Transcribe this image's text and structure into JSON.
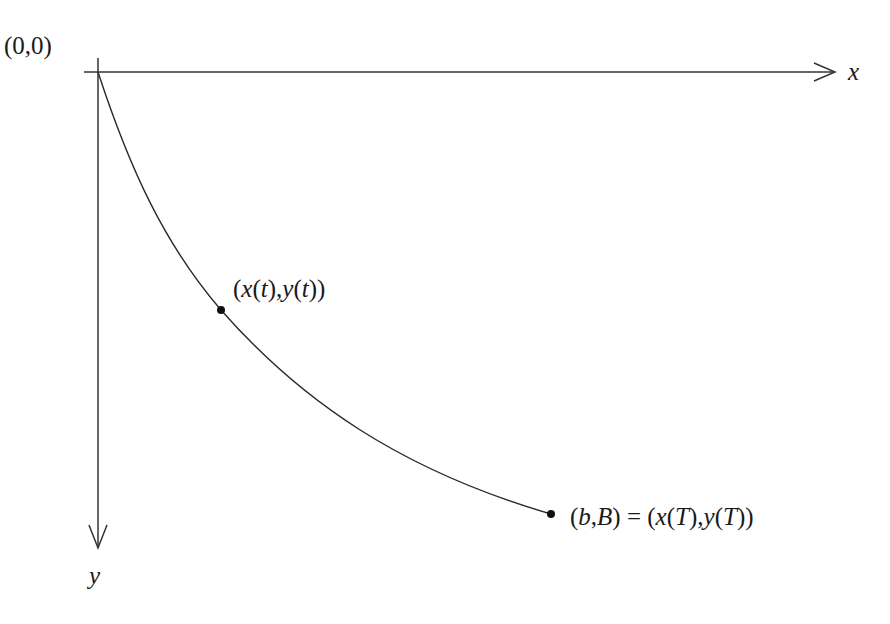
{
  "figure": {
    "origin_label": "(0,0)",
    "x_axis_label": "x",
    "y_axis_label": "y",
    "point_label_t": "(x(t), y(t))",
    "point_label_T": "(b,B) = (x(T), y(T))",
    "colors": {
      "background": "#ffffff",
      "stroke": "#333333",
      "text": "#1a1a1a"
    }
  },
  "labels": {
    "origin": {
      "open": "(",
      "a": "0",
      "comma": ",",
      "b": "0",
      "close": ")"
    },
    "x": "x",
    "y": "y",
    "pt_t": {
      "p1": "(",
      "x": "x",
      "p2": "(",
      "t1": "t",
      "p3": "),",
      "y": "y",
      "p4": "(",
      "t2": "t",
      "p5": "))"
    },
    "pt_T": {
      "p1": "(",
      "b": "b",
      "comma": ",",
      "B": "B",
      "p2": ") = (",
      "x": "x",
      "p3": "(",
      "T1": "T",
      "p4": "),",
      "y": "y",
      "p5": "(",
      "T2": "T",
      "p6": "))"
    }
  }
}
